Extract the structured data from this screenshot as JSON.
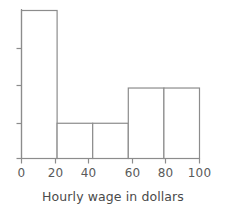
{
  "chart_data": {
    "type": "bar",
    "title": "",
    "subtitle": "",
    "xlabel": "Hourly wage in dollars",
    "ylabel": "",
    "bin_edges": [
      0,
      20,
      40,
      60,
      80,
      100
    ],
    "categories": [
      "0-20",
      "20-40",
      "40-60",
      "60-80",
      "80-100"
    ],
    "values": [
      4.2,
      1,
      1,
      2,
      2
    ],
    "xlim": [
      0,
      100
    ],
    "ylim": [
      0,
      4.5
    ],
    "xticks": [
      0,
      20,
      40,
      60,
      80,
      100
    ],
    "xtick_labels": [
      "0",
      "20",
      "40",
      "60",
      "80",
      "100"
    ],
    "yticks": [
      0,
      1,
      2,
      3
    ],
    "ytick_labels": [
      "",
      "",
      "",
      ""
    ],
    "grid": false,
    "legend": null,
    "bar_fill": "#ffffff",
    "bar_edge_color": "#8c8c8c",
    "axis_color": "#8c8c8c",
    "text_color": "#4a4a4a",
    "background": "#ffffff",
    "annotations": []
  },
  "axes": {
    "x_title": "Hourly wage in dollars",
    "x_tick_0": "0",
    "x_tick_1": "20",
    "x_tick_2": "40",
    "x_tick_3": "60",
    "x_tick_4": "80",
    "x_tick_5": "100"
  }
}
